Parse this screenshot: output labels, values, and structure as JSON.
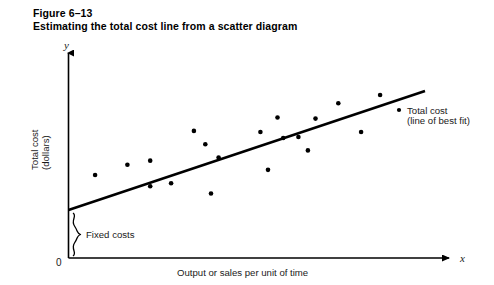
{
  "figure": {
    "number_label": "Figure 6–13",
    "caption": "Estimating the total cost line from a scatter diagram"
  },
  "axes": {
    "y_letter": "y",
    "x_letter": "x",
    "origin_label": "0",
    "y_title_line1": "Total cost",
    "y_title_line2": "(dollars)",
    "x_title": "Output or sales per unit of time"
  },
  "annotations": {
    "fixed_costs": "Fixed costs",
    "series_label_line1": "Total cost",
    "series_label_line2": "(line of best fit)"
  },
  "colors": {
    "ink": "#000000",
    "text": "#1a1a1a",
    "background": "#ffffff"
  },
  "chart_data": {
    "type": "scatter",
    "title": "Estimating the total cost line from a scatter diagram",
    "xlabel": "Output or sales per unit of time",
    "ylabel": "Total cost (dollars)",
    "xlim": [
      0,
      100
    ],
    "ylim": [
      0,
      100
    ],
    "grid": false,
    "legend_position": "right",
    "axis_style": "arrow",
    "points": [
      {
        "x": 7.0,
        "y": 40.5
      },
      {
        "x": 15.5,
        "y": 45.5
      },
      {
        "x": 21.5,
        "y": 47.5
      },
      {
        "x": 21.5,
        "y": 35.0
      },
      {
        "x": 27.0,
        "y": 36.5
      },
      {
        "x": 33.0,
        "y": 62.0
      },
      {
        "x": 36.0,
        "y": 55.5
      },
      {
        "x": 37.5,
        "y": 31.5
      },
      {
        "x": 39.5,
        "y": 49.0
      },
      {
        "x": 50.5,
        "y": 61.5
      },
      {
        "x": 52.5,
        "y": 43.0
      },
      {
        "x": 55.0,
        "y": 68.5
      },
      {
        "x": 56.5,
        "y": 58.5
      },
      {
        "x": 60.5,
        "y": 59.0
      },
      {
        "x": 63.0,
        "y": 52.5
      },
      {
        "x": 65.0,
        "y": 68.0
      },
      {
        "x": 71.0,
        "y": 75.5
      },
      {
        "x": 77.0,
        "y": 61.5
      },
      {
        "x": 82.0,
        "y": 79.5
      }
    ],
    "series": [
      {
        "name": "Total cost (line of best fit)",
        "type": "line",
        "fit": "best-fit",
        "intercept_y": 31.0,
        "endpoint_y": 81.0,
        "x_start": 0,
        "x_end": 89
      }
    ],
    "callouts": [
      {
        "label": "Fixed costs",
        "kind": "brace",
        "from_y": 0,
        "to_y": 31.0
      },
      {
        "label": "Total cost (line of best fit)",
        "kind": "legend-dot"
      }
    ]
  }
}
